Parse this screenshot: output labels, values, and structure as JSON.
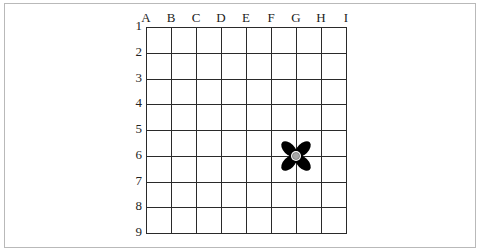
{
  "grid": {
    "columns": [
      "A",
      "B",
      "C",
      "D",
      "E",
      "F",
      "G",
      "H",
      "I"
    ],
    "rows": [
      "1",
      "2",
      "3",
      "4",
      "5",
      "6",
      "7",
      "8",
      "9"
    ]
  },
  "marker": {
    "icon": "four-petal-flower-icon",
    "column": "G",
    "row": "6",
    "petal_color": "#000000",
    "center_color": "#a8a8a8"
  }
}
